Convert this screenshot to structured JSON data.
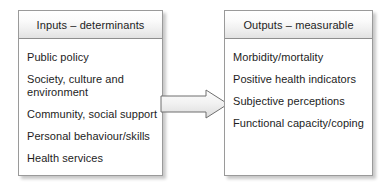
{
  "diagram": {
    "type": "flow",
    "direction": "left-to-right",
    "nodes": [
      {
        "id": "inputs",
        "header": "Inputs – determinants",
        "items": [
          "Public policy",
          "Society, culture and\nenvironment",
          "Community, social support",
          "Personal behaviour/skills",
          "Health services"
        ]
      },
      {
        "id": "outputs",
        "header": "Outputs – measurable",
        "items": [
          "Morbidity/mortality",
          "Positive health indicators",
          "Subjective perceptions",
          "Functional capacity/coping"
        ]
      }
    ],
    "connector": {
      "name": "block-arrow",
      "from": "inputs",
      "to": "outputs"
    },
    "colors": {
      "background": "#ffffff",
      "text": "#1d1d1d",
      "box_border": "#9a9a9a",
      "header_gradient_top": "#ffffff",
      "header_gradient_bottom": "#e2e2e2",
      "arrow_fill": "#ededed",
      "arrow_stroke": "#6f6f6f"
    }
  }
}
